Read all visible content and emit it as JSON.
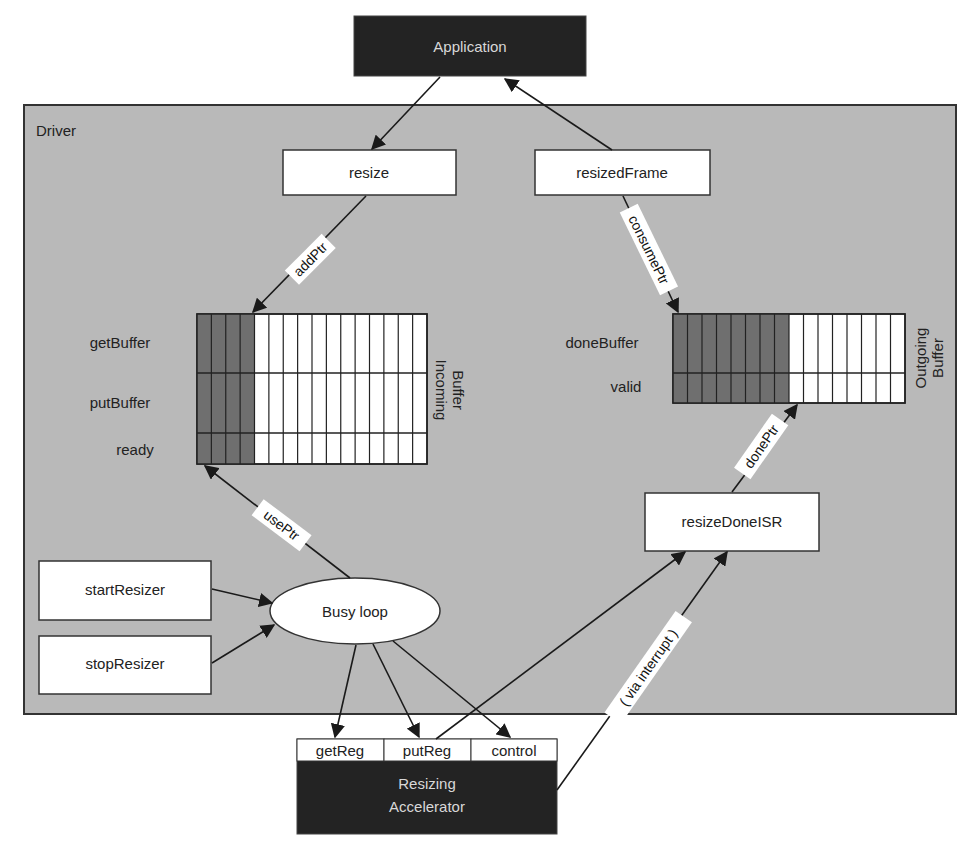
{
  "colors": {
    "driver_bg": "#b9b9b9",
    "dark_box": "#232323",
    "buffer_filled": "#6f6f6f",
    "line": "#1a1a1a"
  },
  "nodes": {
    "application": {
      "label": "Application"
    },
    "driver": {
      "label": "Driver"
    },
    "resize": {
      "label": "resize"
    },
    "resized_frame": {
      "label": "resizedFrame"
    },
    "start_resizer": {
      "label": "startResizer"
    },
    "stop_resizer": {
      "label": "stopResizer"
    },
    "busy_loop": {
      "label": "Busy loop"
    },
    "resize_done_isr": {
      "label": "resizeDoneISR"
    },
    "accelerator": {
      "label_line1": "Resizing",
      "label_line2": "Accelerator"
    }
  },
  "incoming_buffer": {
    "title_line1": "Incoming",
    "title_line2": "Buffer",
    "rows": [
      "getBuffer",
      "putBuffer",
      "ready"
    ],
    "columns": 16,
    "filled_columns": 4
  },
  "outgoing_buffer": {
    "title_line1": "Outgoing",
    "title_line2": "Buffer",
    "rows": [
      "doneBuffer",
      "valid"
    ],
    "columns": 16,
    "filled_columns": 8
  },
  "registers": [
    "getReg",
    "putReg",
    "control"
  ],
  "edges": {
    "add_ptr": "addPtr",
    "consume_ptr": "consumePtr",
    "use_ptr": "usePtr",
    "done_ptr": "donePtr",
    "via_interrupt": "( via interrupt )"
  }
}
